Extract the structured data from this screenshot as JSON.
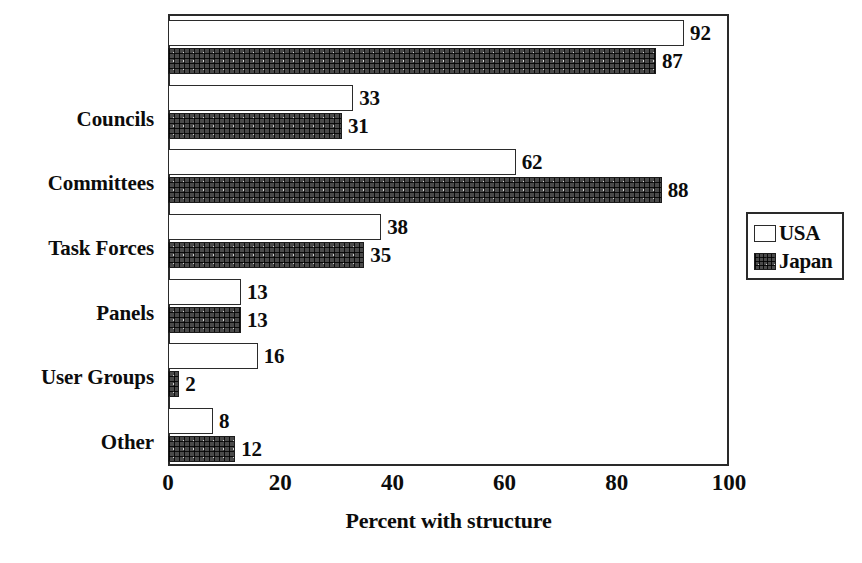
{
  "chart_data": {
    "type": "bar",
    "orientation": "horizontal",
    "title": "",
    "xlabel": "Percent with structure",
    "ylabel": "",
    "xlim": [
      0,
      100
    ],
    "xticks": [
      0,
      20,
      40,
      60,
      80,
      100
    ],
    "xtick_labels": [
      "0",
      "20",
      "40",
      "60",
      "80",
      "100"
    ],
    "grid": false,
    "legend_position": "right",
    "categories": [
      "",
      "Councils",
      "Committees",
      "Task Forces",
      "Panels",
      "User Groups",
      "Other"
    ],
    "series": [
      {
        "name": "USA",
        "swatch": "usa",
        "values": [
          92,
          33,
          62,
          38,
          13,
          16,
          8
        ],
        "value_labels": [
          "92",
          "33",
          "62",
          "38",
          "13",
          "16",
          "8"
        ]
      },
      {
        "name": "Japan",
        "swatch": "japan",
        "values": [
          87,
          31,
          88,
          35,
          13,
          2,
          12
        ],
        "value_labels": [
          "87",
          "31",
          "88",
          "35",
          "13",
          "2",
          "12"
        ]
      }
    ]
  },
  "legend": {
    "items": [
      {
        "label": "USA",
        "swatch": "usa"
      },
      {
        "label": "Japan",
        "swatch": "japan"
      }
    ]
  },
  "axis": {
    "x_title": "Percent with structure"
  }
}
